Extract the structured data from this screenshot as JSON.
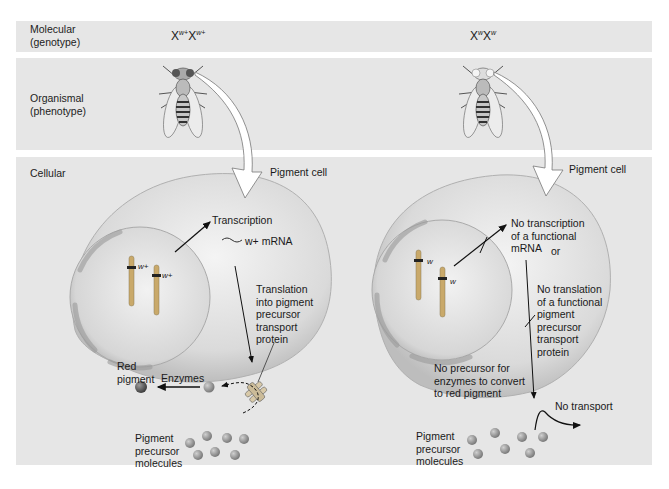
{
  "rows": {
    "molecular": {
      "label": "Molecular\n(genotype)"
    },
    "organismal": {
      "label": "Organismal\n(phenotype)"
    },
    "cellular": {
      "label": "Cellular"
    }
  },
  "wild_type": {
    "genotype": {
      "base1": "X",
      "sup1": "w+",
      "base2": "X",
      "sup2": "w+"
    },
    "phenotype": "red-eyed fly",
    "cell_label": "Pigment cell",
    "allele_label_1": "w+",
    "allele_label_2": "w+",
    "transcription": "Transcription",
    "mrna": "w+ mRNA",
    "translation": "Translation\ninto pigment\nprecursor\ntransport\nprotein",
    "red_pigment": "Red\npigment",
    "enzymes": "Enzymes",
    "precursor": "Pigment\nprecursor\nmolecules"
  },
  "mutant": {
    "genotype": {
      "base1": "X",
      "sup1": "w",
      "base2": "X",
      "sup2": "w"
    },
    "phenotype": "white-eyed fly",
    "cell_label": "Pigment cell",
    "allele_label_1": "w",
    "allele_label_2": "w",
    "no_transcription": "No transcription\nof a functional\nmRNA",
    "or": "or",
    "no_translation": "No translation\nof a functional\npigment\nprecursor\ntransport\nprotein",
    "no_precursor": "No precursor for\nenzymes to convert\nto red pigment",
    "no_transport": "No transport",
    "precursor": "Pigment\nprecursor\nmolecules"
  },
  "colors": {
    "band": "#e6e6e6",
    "cell": "#d9d9d9",
    "nucleus": "#e4e4e4",
    "pigment_ball": "#8a8a8a",
    "red_pigment_ball": "#555555"
  }
}
